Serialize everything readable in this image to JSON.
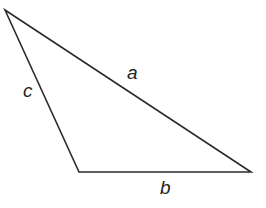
{
  "diagram": {
    "type": "triangle",
    "vertices": [
      [
        5,
        10
      ],
      [
        79,
        172
      ],
      [
        251,
        172
      ]
    ],
    "stroke_color": "#2a2a2a",
    "labels": {
      "a": "a",
      "b": "b",
      "c": "c"
    }
  }
}
